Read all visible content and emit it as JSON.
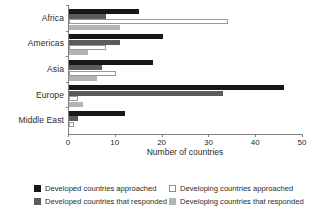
{
  "chart_data": {
    "type": "bar",
    "orientation": "horizontal",
    "title": "",
    "xlabel": "Number of countries",
    "ylabel": "",
    "xlim": [
      0,
      50
    ],
    "xticks": [
      0,
      10,
      20,
      30,
      40,
      50
    ],
    "grid": false,
    "legend_position": "bottom",
    "categories": [
      "Africa",
      "Americas",
      "Asia",
      "Europe",
      "Middle East"
    ],
    "series": [
      {
        "name": "Developed countries approached",
        "color": "#171717",
        "values": [
          15,
          20,
          18,
          46,
          12
        ]
      },
      {
        "name": "Developed countries that responded",
        "color": "#5b5b5b",
        "values": [
          8,
          11,
          7,
          33,
          2
        ]
      },
      {
        "name": "Developing countries approached",
        "color": "#ffffff",
        "values": [
          34,
          8,
          10,
          2,
          1
        ]
      },
      {
        "name": "Developing countries that responded",
        "color": "#b4b4b4",
        "values": [
          11,
          4,
          6,
          3,
          0
        ]
      }
    ]
  },
  "axis": {
    "x_title": "Number of countries",
    "x_tick_labels": [
      "0",
      "10",
      "20",
      "30",
      "40",
      "50"
    ],
    "category_labels": [
      "Africa",
      "Americas",
      "Asia",
      "Europe",
      "Middle East"
    ]
  },
  "legend": {
    "entries": [
      "Developed countries approached",
      "Developing countries approached",
      "Developed countries that responded",
      "Developing countries that responded"
    ]
  }
}
